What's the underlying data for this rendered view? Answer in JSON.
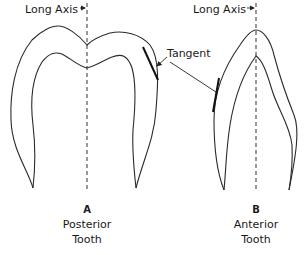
{
  "diagram": {
    "panels": [
      {
        "id": "A",
        "letter": "A",
        "caption_line1": "Posterior",
        "caption_line2": "Tooth",
        "axis_label": "Long Axis",
        "tangent_label": "Tangent"
      },
      {
        "id": "B",
        "letter": "B",
        "caption_line1": "Anterior",
        "caption_line2": "Tooth",
        "axis_label": "Long Axis",
        "tangent_label": "Tangent"
      }
    ],
    "colors": {
      "line": "#2a2a2a",
      "background": "#ffffff"
    }
  }
}
